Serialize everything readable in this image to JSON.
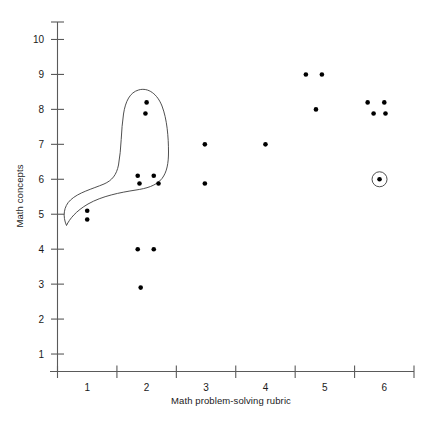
{
  "chart_data": {
    "type": "scatter",
    "title": "",
    "xlabel": "Math problem-solving rubric",
    "ylabel": "Math concepts",
    "xlim": [
      0.5,
      6.5
    ],
    "ylim": [
      0.5,
      10.5
    ],
    "xticks": [
      1,
      2,
      3,
      4,
      5,
      6
    ],
    "xtick_labels": [
      "1",
      "2",
      "3",
      "4",
      "5",
      "6"
    ],
    "yticks": [
      1,
      2,
      3,
      4,
      5,
      6,
      7,
      8,
      9,
      10
    ],
    "ytick_labels": [
      "1",
      "2",
      "3",
      "4",
      "5",
      "6",
      "7",
      "8",
      "9",
      "10"
    ],
    "grid": false,
    "legend": null,
    "points": [
      {
        "x": 1.0,
        "y": 5.1
      },
      {
        "x": 1.0,
        "y": 4.85
      },
      {
        "x": 1.85,
        "y": 4.0
      },
      {
        "x": 2.12,
        "y": 4.0
      },
      {
        "x": 1.9,
        "y": 2.9
      },
      {
        "x": 1.85,
        "y": 6.1
      },
      {
        "x": 2.12,
        "y": 6.1
      },
      {
        "x": 1.88,
        "y": 5.88
      },
      {
        "x": 2.2,
        "y": 5.88
      },
      {
        "x": 2.0,
        "y": 8.2
      },
      {
        "x": 1.98,
        "y": 7.88
      },
      {
        "x": 2.98,
        "y": 7.0
      },
      {
        "x": 2.98,
        "y": 5.88
      },
      {
        "x": 4.0,
        "y": 7.0
      },
      {
        "x": 4.68,
        "y": 9.0
      },
      {
        "x": 4.95,
        "y": 9.0
      },
      {
        "x": 4.85,
        "y": 8.0
      },
      {
        "x": 5.72,
        "y": 8.2
      },
      {
        "x": 6.0,
        "y": 8.2
      },
      {
        "x": 5.82,
        "y": 7.88
      },
      {
        "x": 6.02,
        "y": 7.88
      },
      {
        "x": 5.92,
        "y": 6.0
      }
    ],
    "annotations": [
      {
        "kind": "cluster-outline",
        "label": "hand-drawn loop enclosing low-rubric cluster",
        "encloses": [
          {
            "x": 1.0,
            "y": 5.1
          },
          {
            "x": 1.0,
            "y": 4.85
          },
          {
            "x": 1.85,
            "y": 6.1
          },
          {
            "x": 2.12,
            "y": 6.1
          },
          {
            "x": 1.88,
            "y": 5.88
          },
          {
            "x": 2.2,
            "y": 5.88
          },
          {
            "x": 2.0,
            "y": 8.2
          },
          {
            "x": 1.98,
            "y": 7.88
          }
        ]
      },
      {
        "kind": "highlight-ring",
        "label": "circled outlier point",
        "x": 5.92,
        "y": 6.0
      }
    ],
    "colors": {
      "point": "#000000",
      "axis": "#5a5a5a",
      "annotation": "#3b3b3b",
      "background": "#ffffff"
    }
  }
}
